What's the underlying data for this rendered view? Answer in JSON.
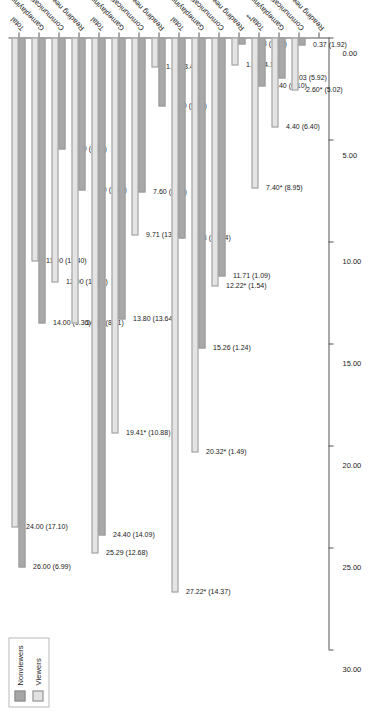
{
  "legend": {
    "position": "top-left",
    "entries": [
      {
        "label": "Nonviewers",
        "color": "#a8a8a8"
      },
      {
        "label": "Viewers",
        "color": "#e4e4e4"
      }
    ]
  },
  "chart_data": {
    "type": "bar",
    "orientation": "horizontal",
    "title": "",
    "xlabel": "",
    "ylabel": "",
    "grid": false,
    "axis_reversed": true,
    "ylim": [
      0,
      30
    ],
    "tick_labels": [
      "30.00",
      "25.00",
      "20.00",
      "15.00",
      "10.00",
      "5.00",
      "0.00"
    ],
    "tick_values": [
      30,
      25,
      20,
      15,
      10,
      5,
      0
    ],
    "categories": [
      "Total",
      "Gameplaying",
      "Communicating",
      "Reading news",
      "Total",
      "Gameplaying",
      "Communicating",
      "Reading news",
      "Total",
      "Gameplaying",
      "Communicating",
      "Reading news",
      "Total**",
      "Gameplaying",
      "Communicating",
      "Reading news"
    ],
    "series": [
      {
        "name": "Nonviewers",
        "color": "#a8a8a8",
        "values": [
          26.0,
          14.0,
          5.5,
          7.5,
          24.4,
          13.8,
          7.6,
          3.4,
          9.83,
          15.26,
          11.71,
          0.33,
          2.4,
          2.03,
          0.37,
          null
        ],
        "sd": [
          6.99,
          9.36,
          4.37,
          7.16,
          14.09,
          13.64,
          8.79,
          5.9,
          10.94,
          1.24,
          1.09,
          1.26,
          6.1,
          5.92,
          1.92,
          null
        ],
        "labels": [
          "26.00 (6.99)",
          "14.00 (9.36)",
          "5.50 (4.37)",
          "7.50 (7.16)",
          "24.40 (14.09)",
          "13.80 (13.64)",
          "7.60 (8.79)",
          "3.40 (5.90)",
          "9.83 (10.94)",
          "15.26 (1.24)",
          "11.71 (1.09)",
          "0.33 (1.26)",
          "2.40 (6.10)",
          "2.03 (5.92)",
          "0.37 (1.92)"
        ]
      },
      {
        "name": "Viewers",
        "color": "#e4e4e4",
        "values": [
          24.0,
          11.0,
          12.0,
          14.0,
          25.29,
          19.41,
          9.71,
          1.47,
          27.22,
          20.32,
          12.22,
          1.39,
          7.4,
          4.4,
          2.6,
          null
        ],
        "sd": [
          17.1,
          11.4,
          12.54,
          8.21,
          12.68,
          10.88,
          13.16,
          3.42,
          14.37,
          1.49,
          1.54,
          4.13,
          8.95,
          6.4,
          5.02,
          null
        ],
        "labels": [
          "24.00 (17.10)",
          "11.00 (11.40)",
          "12.00 (12.54)",
          "14.00 (8.21)",
          "25.29 (12.68)",
          "19.41* (10.88)",
          "9.71 (13.16)",
          "1.47 (3.42)",
          "27.22* (14.37)",
          "20.32* (1.49)",
          "12.22* (1.54)",
          "1.39 (4.13)",
          "7.40* (8.95)",
          "4.40 (6.40)",
          "2.60* (5.02)"
        ]
      }
    ],
    "groups": [
      {
        "index": 0,
        "pairs": [
          {
            "category": "Total",
            "nonviewers": "26.00 (6.99)",
            "viewers": "24.00 (17.10)"
          },
          {
            "category": "Gameplaying",
            "nonviewers": "14.00 (9.36)",
            "viewers": "11.00 (11.40)"
          },
          {
            "category": "Communicating",
            "nonviewers": "5.50 (4.37)",
            "viewers": "12.00 (12.54)"
          },
          {
            "category": "Reading news",
            "nonviewers": "7.50 (7.16)",
            "viewers": "14.00 (8.21)"
          }
        ]
      },
      {
        "index": 1,
        "pairs": [
          {
            "category": "Total",
            "nonviewers": "24.40 (14.09)",
            "viewers": "25.29 (12.68)"
          },
          {
            "category": "Gameplaying",
            "nonviewers": "13.80 (13.64)",
            "viewers": "19.41* (10.88)"
          },
          {
            "category": "Communicating",
            "nonviewers": "7.60 (8.79)",
            "viewers": "9.71 (13.16)"
          },
          {
            "category": "Reading news",
            "nonviewers": "3.40 (5.90)",
            "viewers": "1.47 (3.42)"
          }
        ]
      },
      {
        "index": 2,
        "pairs": [
          {
            "category": "Total",
            "nonviewers": "9.83 (10.94)",
            "viewers": "27.22* (14.37)"
          },
          {
            "category": "Gameplaying",
            "nonviewers": "15.26 (1.24)",
            "viewers": "20.32* (1.49)"
          },
          {
            "category": "Communicating",
            "nonviewers": "11.71 (1.09)",
            "viewers": "12.22* (1.54)"
          },
          {
            "category": "Reading news",
            "nonviewers": "0.33 (1.26)",
            "viewers": "1.39 (4.13)"
          }
        ]
      },
      {
        "index": 3,
        "pairs": [
          {
            "category": "Total**",
            "nonviewers": "2.40 (6.10)",
            "viewers": "7.40* (8.95)"
          },
          {
            "category": "Gameplaying",
            "nonviewers": "2.03 (5.92)",
            "viewers": "4.40 (6.40)"
          },
          {
            "category": "Communicating",
            "nonviewers": "0.37 (1.92)",
            "viewers": "2.60* (5.02)"
          },
          {
            "category": "Reading news",
            "nonviewers": null,
            "viewers": null
          }
        ]
      }
    ]
  }
}
